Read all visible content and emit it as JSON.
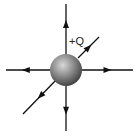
{
  "diagram": {
    "charge_label": "+Q",
    "charge": {
      "cx": 66,
      "cy": 70,
      "r": 16
    },
    "colors": {
      "line": "#111111",
      "sphere_light": "#c8c8c8",
      "sphere_dark": "#4a4a4a"
    },
    "field_lines": [
      {
        "name": "up",
        "x1": 66,
        "y1": 54,
        "x2": 66,
        "y2": 4,
        "arrow_at": 0.6
      },
      {
        "name": "down",
        "x1": 66,
        "y1": 86,
        "x2": 66,
        "y2": 131,
        "arrow_at": 0.55
      },
      {
        "name": "left",
        "x1": 50,
        "y1": 70,
        "x2": 6,
        "y2": 70,
        "arrow_at": 0.55
      },
      {
        "name": "right",
        "x1": 82,
        "y1": 70,
        "x2": 133,
        "y2": 70,
        "arrow_at": 0.5
      },
      {
        "name": "up-right",
        "x1": 78,
        "y1": 58,
        "x2": 99,
        "y2": 37,
        "arrow_at": 0.5
      },
      {
        "name": "down-left",
        "x1": 58,
        "y1": 78,
        "x2": 23,
        "y2": 114,
        "arrow_at": 0.5
      }
    ]
  }
}
